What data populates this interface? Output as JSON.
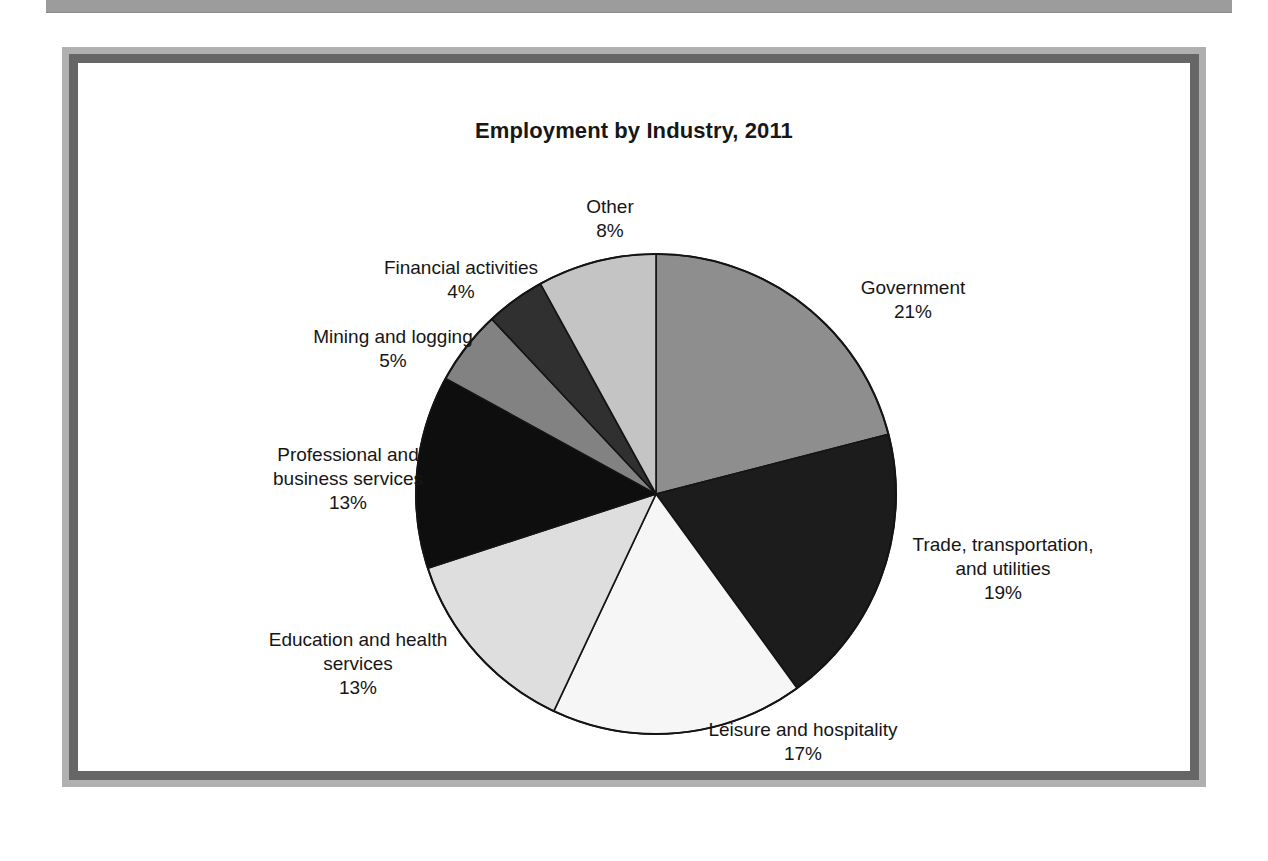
{
  "page": {
    "background_color": "#ffffff",
    "top_rule_color": "#9c9c9c",
    "frame_outer_color": "#b0b0b0",
    "frame_inner_color": "#666666"
  },
  "chart_data": {
    "type": "pie",
    "title": "Employment by Industry, 2011",
    "xlabel": "",
    "ylabel": "",
    "legend_position": "none",
    "grid": false,
    "start_angle_deg": 0,
    "direction": "clockwise",
    "value_unit": "%",
    "categories": [
      "Government",
      "Trade, transportation, and utilities",
      "Leisure and hospitality",
      "Education and health services",
      "Professional and business services",
      "Mining and logging",
      "Financial activities",
      "Other"
    ],
    "values": [
      21,
      19,
      17,
      13,
      13,
      5,
      4,
      8
    ],
    "slices": [
      {
        "name": "Government",
        "label_text": "Government\n21%",
        "value": 21,
        "value_text": "21%",
        "color": "#8e8e8e"
      },
      {
        "name": "Trade, transportation, and utilities",
        "label_text": "Trade, transportation,\nand utilities\n19%",
        "value": 19,
        "value_text": "19%",
        "color": "#1c1c1c"
      },
      {
        "name": "Leisure and hospitality",
        "label_text": "Leisure and hospitality\n17%",
        "value": 17,
        "value_text": "17%",
        "color": "#f6f6f6"
      },
      {
        "name": "Education and health services",
        "label_text": "Education and health\nservices\n13%",
        "value": 13,
        "value_text": "13%",
        "color": "#dedede"
      },
      {
        "name": "Professional and business services",
        "label_text": "Professional and\nbusiness services\n13%",
        "value": 13,
        "value_text": "13%",
        "color": "#0e0e0e"
      },
      {
        "name": "Mining and logging",
        "label_text": "Mining and logging\n5%",
        "value": 5,
        "value_text": "5%",
        "color": "#828282"
      },
      {
        "name": "Financial activities",
        "label_text": "Financial activities\n4%",
        "value": 4,
        "value_text": "4%",
        "color": "#303030"
      },
      {
        "name": "Other",
        "label_text": "Other\n8%",
        "value": 8,
        "value_text": "8%",
        "color": "#c4c4c4"
      }
    ]
  }
}
